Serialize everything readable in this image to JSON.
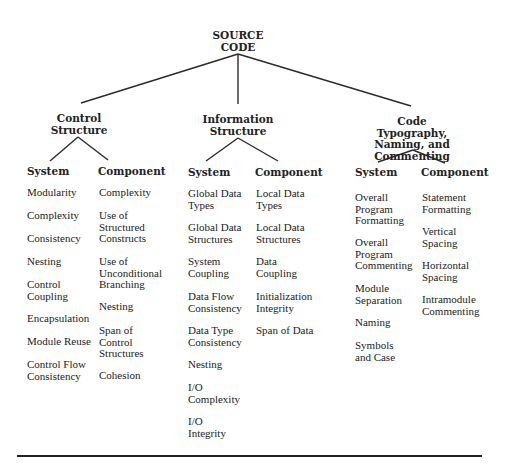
{
  "root": {
    "label": "SOURCE\nCODE",
    "x": 238,
    "y": 30
  },
  "colors": {
    "line": "#2a2a2a",
    "text": "#222222",
    "background": "#ffffff"
  },
  "categories": [
    {
      "label": "Control\nStructure",
      "x": 79,
      "y": 113,
      "system": {
        "label": "System",
        "x": 27,
        "y": 165,
        "items": [
          {
            "text": "Modularity",
            "y": 187
          },
          {
            "text": "Complexity",
            "y": 210
          },
          {
            "text": "Consistency",
            "y": 233
          },
          {
            "text": "Nesting",
            "y": 256
          },
          {
            "text": "Control\n Coupling",
            "y": 279
          },
          {
            "text": "Encapsulation",
            "y": 313
          },
          {
            "text": "Module Reuse",
            "y": 336
          },
          {
            "text": "Control Flow\nConsistency",
            "y": 359
          }
        ]
      },
      "component": {
        "label": "Component",
        "x": 98,
        "y": 165,
        "items": [
          {
            "text": "Complexity",
            "y": 187
          },
          {
            "text": "Use of\nStructured\nConstructs",
            "y": 210
          },
          {
            "text": "Use of\nUnconditional\nBranching",
            "y": 256
          },
          {
            "text": "Nesting",
            "y": 301
          },
          {
            "text": "Span of\nControl\nStructures",
            "y": 325
          },
          {
            "text": "Cohesion",
            "y": 370
          }
        ]
      }
    },
    {
      "label": "Information\nStructure",
      "x": 238,
      "y": 114,
      "system": {
        "label": "System",
        "x": 188,
        "y": 166,
        "items": [
          {
            "text": "Global Data\nTypes",
            "y": 188
          },
          {
            "text": "Global Data\nStructures",
            "y": 222
          },
          {
            "text": "System\nCoupling",
            "y": 256
          },
          {
            "text": "Data Flow\nConsistency",
            "y": 291
          },
          {
            "text": "Data Type\nConsistency",
            "y": 325
          },
          {
            "text": "Nesting",
            "y": 359
          },
          {
            "text": "I/O\nComplexity",
            "y": 382
          },
          {
            "text": "I/O\nIntegrity",
            "y": 416
          }
        ]
      },
      "component": {
        "label": "Component",
        "x": 255,
        "y": 166,
        "items": [
          {
            "text": "Local Data\nTypes",
            "y": 188
          },
          {
            "text": "Local Data\nStructures",
            "y": 222
          },
          {
            "text": "Data\nCoupling",
            "y": 256
          },
          {
            "text": "Initialization\nIntegrity",
            "y": 291
          },
          {
            "text": "Span of Data",
            "y": 325
          }
        ]
      }
    },
    {
      "label": "Code Typography,\nNaming, and\nCommenting",
      "x": 412,
      "y": 116,
      "system": {
        "label": "System",
        "x": 355,
        "y": 166,
        "items": [
          {
            "text": "Overall\nProgram\nFormatting",
            "y": 192
          },
          {
            "text": "Overall\nProgram\nCommenting",
            "y": 237
          },
          {
            "text": "Module\nSeparation",
            "y": 283
          },
          {
            "text": "Naming",
            "y": 317
          },
          {
            "text": "Symbols\nand Case",
            "y": 340
          }
        ]
      },
      "component": {
        "label": "Component",
        "x": 421,
        "y": 166,
        "items": [
          {
            "text": "Statement\nFormatting",
            "y": 192
          },
          {
            "text": "Vertical\nSpacing",
            "y": 226
          },
          {
            "text": "Horizontal\nSpacing",
            "y": 260
          },
          {
            "text": "Intramodule\nCommenting",
            "y": 294
          }
        ]
      }
    }
  ],
  "edges": [
    {
      "x1": 238,
      "y1": 54,
      "x2": 81,
      "y2": 103
    },
    {
      "x1": 238,
      "y1": 54,
      "x2": 238,
      "y2": 104
    },
    {
      "x1": 238,
      "y1": 54,
      "x2": 411,
      "y2": 106
    },
    {
      "x1": 78,
      "y1": 137,
      "x2": 50,
      "y2": 161
    },
    {
      "x1": 78,
      "y1": 137,
      "x2": 108,
      "y2": 160
    },
    {
      "x1": 238,
      "y1": 138,
      "x2": 206,
      "y2": 161
    },
    {
      "x1": 238,
      "y1": 138,
      "x2": 278,
      "y2": 161
    },
    {
      "x1": 413,
      "y1": 150,
      "x2": 378,
      "y2": 162
    },
    {
      "x1": 413,
      "y1": 150,
      "x2": 445,
      "y2": 163
    }
  ],
  "bottom_rule": {
    "x1": 17,
    "y1": 456,
    "x2": 482,
    "y2": 456
  }
}
